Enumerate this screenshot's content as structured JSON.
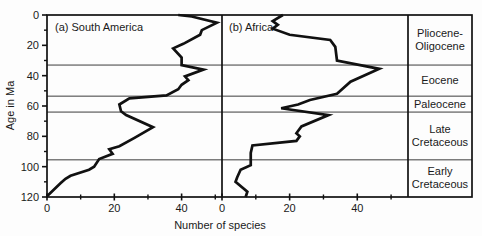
{
  "figure": {
    "background_color": "#fdfdfd",
    "ink_color": "#1a1a1a"
  },
  "chart_data": {
    "type": "line",
    "title": "",
    "xlabel": "Number of species",
    "ylabel": "Age in Ma",
    "orientation": "age increases downward on vertical axis; species count on horizontal axis",
    "y_axis": {
      "label": "Age in Ma",
      "min": 0,
      "max": 120,
      "major_ticks": [
        0,
        20,
        40,
        60,
        80,
        100,
        120
      ],
      "minor_ticks": [
        10,
        30,
        50,
        70,
        90,
        110
      ]
    },
    "x_axis": {
      "label": "Number of species",
      "major_ticks": [
        0,
        20,
        40
      ],
      "minor_ticks": [
        10,
        30,
        50
      ]
    },
    "epochs": {
      "boundaries_ma": [
        33,
        53.5,
        64,
        95.5
      ],
      "labels": [
        {
          "text": "Pliocene-\nOligocene",
          "from_ma": 0,
          "to_ma": 33
        },
        {
          "text": "Eocene",
          "from_ma": 33,
          "to_ma": 53.5
        },
        {
          "text": "Paleocene",
          "from_ma": 53.5,
          "to_ma": 64
        },
        {
          "text": "Late\nCretaceous",
          "from_ma": 64,
          "to_ma": 95.5
        },
        {
          "text": "Early\nCretaceous",
          "from_ma": 95.5,
          "to_ma": 120
        }
      ]
    },
    "panels": [
      {
        "label": "(a) South America",
        "xlim": [
          0,
          52
        ],
        "series_name": "South America",
        "points_age_vs_species": [
          [
            0,
            39
          ],
          [
            1,
            43
          ],
          [
            5,
            50.5
          ],
          [
            10,
            46
          ],
          [
            13,
            45.5
          ],
          [
            19,
            40.5
          ],
          [
            22,
            37.5
          ],
          [
            28,
            40
          ],
          [
            33,
            40
          ],
          [
            36,
            46.5
          ],
          [
            40.5,
            41
          ],
          [
            43,
            42
          ],
          [
            46,
            40
          ],
          [
            49,
            39
          ],
          [
            53,
            35.5
          ],
          [
            55,
            24.5
          ],
          [
            59,
            21.5
          ],
          [
            63.5,
            22
          ],
          [
            66,
            23.5
          ],
          [
            74,
            31.5
          ],
          [
            81,
            26
          ],
          [
            86.5,
            21.5
          ],
          [
            88.5,
            18.5
          ],
          [
            91.5,
            19.5
          ],
          [
            95,
            15.5
          ],
          [
            100,
            14
          ],
          [
            102,
            12.5
          ],
          [
            106,
            7
          ],
          [
            108,
            5.5
          ],
          [
            111,
            4
          ],
          [
            119.5,
            0
          ]
        ]
      },
      {
        "label": "(b) Africa",
        "xlim": [
          0,
          55
        ],
        "series_name": "Africa",
        "points_age_vs_species": [
          [
            0,
            18
          ],
          [
            4,
            15
          ],
          [
            6.5,
            16.5
          ],
          [
            9,
            15
          ],
          [
            13,
            20
          ],
          [
            16.5,
            32
          ],
          [
            21,
            33.5
          ],
          [
            30,
            34
          ],
          [
            35.5,
            46.5
          ],
          [
            44,
            38
          ],
          [
            52,
            34
          ],
          [
            56,
            26
          ],
          [
            59,
            22.5
          ],
          [
            61.5,
            17.5
          ],
          [
            66,
            31.5
          ],
          [
            73.5,
            23.5
          ],
          [
            78,
            22
          ],
          [
            80,
            23
          ],
          [
            83,
            22
          ],
          [
            86,
            9
          ],
          [
            91,
            8.5
          ],
          [
            99,
            8.5
          ],
          [
            102,
            5.5
          ],
          [
            107,
            4.5
          ],
          [
            110,
            4
          ],
          [
            116.5,
            7.5
          ],
          [
            120,
            7
          ]
        ]
      }
    ]
  }
}
